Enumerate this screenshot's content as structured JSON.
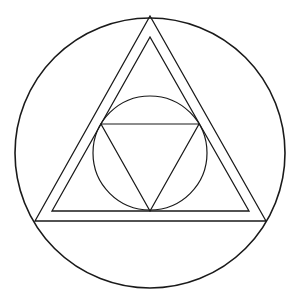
{
  "diagram": {
    "title": "",
    "colors": {
      "background": "#ffffff",
      "line": "#1a1a1a"
    },
    "shapes": [
      {
        "id": "outer-circle",
        "type": "circle"
      },
      {
        "id": "outer-triangle",
        "type": "triangle",
        "orientation": "up"
      },
      {
        "id": "inner-triangle",
        "type": "triangle",
        "orientation": "up"
      },
      {
        "id": "inscribed-circle",
        "type": "circle"
      },
      {
        "id": "inverted-triangle",
        "type": "triangle",
        "orientation": "down"
      }
    ],
    "labels": []
  }
}
